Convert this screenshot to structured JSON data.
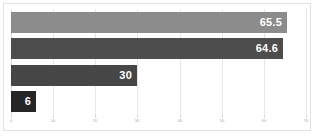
{
  "chart_data": {
    "type": "bar",
    "orientation": "horizontal",
    "title": "",
    "subtitle": "",
    "xlabel": "",
    "ylabel": "",
    "categories": [
      "",
      "",
      "",
      ""
    ],
    "values": [
      65.5,
      64.6,
      30,
      6
    ],
    "data_labels": [
      "65.5",
      "64.6",
      "30",
      "6"
    ],
    "bar_colors": [
      "#8c8c8c",
      "#4d4d4d",
      "#464646",
      "#262626"
    ],
    "xlim": [
      0,
      70
    ],
    "xticks": [
      0,
      10,
      20,
      30,
      40,
      50,
      60,
      70
    ],
    "xtick_labels": [
      "0",
      "10",
      "20",
      "30",
      "40",
      "50",
      "60",
      "70"
    ],
    "grid": true,
    "grid_axis": "x",
    "legend": false,
    "legend_position": "none",
    "plot_background": "#ffffff",
    "grid_color": "#e6e6e6",
    "frame_color": "#e2e2e2",
    "label_color": "#ffffff",
    "tick_label_color": "#a6a6a6"
  }
}
